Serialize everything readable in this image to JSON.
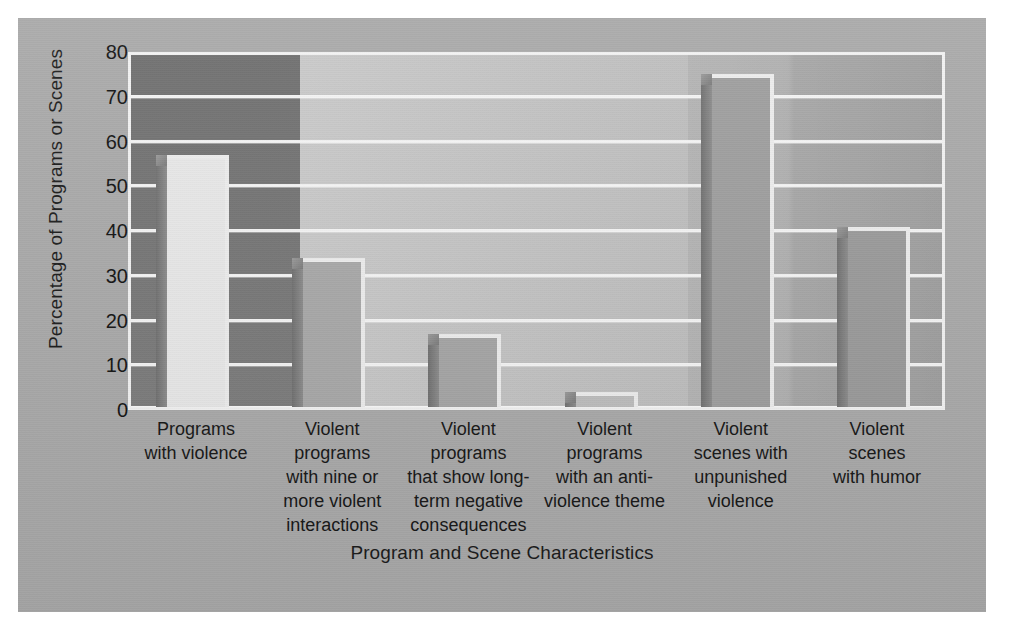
{
  "chart_data": {
    "type": "bar",
    "title": "",
    "xlabel": "Program and Scene Characteristics",
    "ylabel": "Percentage of Programs or Scenes",
    "ylim": [
      0,
      80
    ],
    "ytick_step": 10,
    "yticks": [
      80,
      70,
      60,
      50,
      40,
      30,
      20,
      10,
      0
    ],
    "grid": "horizontal",
    "legend": "none",
    "categories": [
      "Programs with violence",
      "Violent programs with nine or more violent interactions",
      "Violent programs that show long-term negative consequences",
      "Violent programs with an anti-violence theme",
      "Violent scenes with unpunished violence",
      "Violent scenes with humor"
    ],
    "category_lines": [
      [
        "Programs",
        "with violence"
      ],
      [
        "Violent",
        "programs",
        "with nine or",
        "more violent",
        "interactions"
      ],
      [
        "Violent",
        "programs",
        "that show long-",
        "term negative",
        "consequences"
      ],
      [
        "Violent",
        "programs",
        "with an anti-",
        "violence theme"
      ],
      [
        "Violent",
        "scenes with",
        "unpunished",
        "violence"
      ],
      [
        "Violent",
        "scenes",
        "with humor"
      ]
    ],
    "values": [
      57,
      34,
      17,
      4,
      75,
      41
    ],
    "bar_colors": [
      "#e8e8e8",
      "#a8a8a8",
      "#a5a5a5",
      "#bdbdbd",
      "#9e9e9e",
      "#9a9a9a"
    ],
    "bar_edge_color": "#ededed",
    "gridline_color": "#f4f4f4",
    "plot_background": "#c3c3c3",
    "figure_background": "#a9a9a9",
    "highlight_block_color": "#757575",
    "text_color": "#141414"
  }
}
